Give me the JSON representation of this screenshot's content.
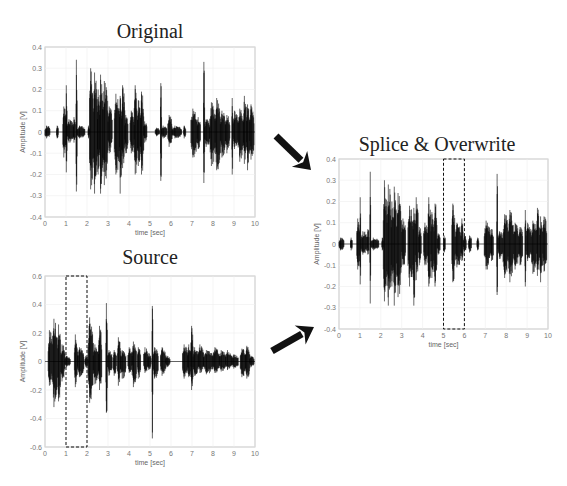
{
  "figure": {
    "arrows": [
      {
        "name": "arrow-original-to-splice",
        "x1": 276,
        "y1": 136,
        "x2": 311,
        "y2": 170
      },
      {
        "name": "arrow-source-to-splice",
        "x1": 272,
        "y1": 351,
        "x2": 314,
        "y2": 327
      }
    ]
  },
  "chart_data": [
    {
      "id": "original",
      "type": "line",
      "title": "Original",
      "xlabel": "time [sec]",
      "ylabel": "Amplitude [V]",
      "xlim": [
        0,
        10
      ],
      "ylim": [
        -0.4,
        0.4
      ],
      "xticks": [
        0,
        1,
        2,
        3,
        4,
        5,
        6,
        7,
        8,
        9,
        10
      ],
      "yticks": [
        0.4,
        0.3,
        0.2,
        0.1,
        0,
        -0.1,
        -0.2,
        -0.3,
        -0.4
      ],
      "ytick_labels": [
        "0.4",
        "0.3",
        "0.2",
        "0.1",
        "0",
        "-0.1",
        "-0.2",
        "-0.3",
        "-0.4"
      ],
      "grid": true,
      "bbox": {
        "left": 45,
        "top": 47,
        "right": 255,
        "bottom": 217
      },
      "title_pos": {
        "x": 150,
        "y": 22
      },
      "bursts": [
        [
          0.0,
          0.25,
          0.03,
          0.03
        ],
        [
          0.55,
          0.65,
          0.03,
          0.03
        ],
        [
          0.85,
          1.0,
          0.12,
          0.12
        ],
        [
          1.0,
          1.05,
          0.22,
          0.19
        ],
        [
          1.05,
          1.35,
          0.06,
          0.05
        ],
        [
          1.35,
          1.45,
          0.07,
          0.05
        ],
        [
          1.48,
          1.53,
          0.34,
          0.28
        ],
        [
          1.53,
          1.9,
          0.03,
          0.03
        ],
        [
          2.05,
          2.12,
          0.03,
          0.03
        ],
        [
          2.12,
          2.3,
          0.3,
          0.27
        ],
        [
          2.3,
          2.5,
          0.28,
          0.29
        ],
        [
          2.5,
          2.6,
          0.2,
          0.2
        ],
        [
          2.6,
          2.75,
          0.27,
          0.29
        ],
        [
          2.75,
          3.0,
          0.24,
          0.25
        ],
        [
          3.0,
          3.2,
          0.12,
          0.1
        ],
        [
          3.3,
          3.55,
          0.18,
          0.2
        ],
        [
          3.55,
          3.65,
          0.17,
          0.29
        ],
        [
          3.65,
          3.8,
          0.22,
          0.17
        ],
        [
          3.8,
          3.95,
          0.08,
          0.1
        ],
        [
          4.05,
          4.25,
          0.1,
          0.1
        ],
        [
          4.25,
          4.4,
          0.22,
          0.2
        ],
        [
          4.4,
          4.55,
          0.15,
          0.16
        ],
        [
          4.55,
          4.7,
          0.19,
          0.2
        ],
        [
          4.7,
          4.85,
          0.05,
          0.05
        ],
        [
          5.25,
          5.45,
          0.02,
          0.02
        ],
        [
          5.5,
          5.55,
          0.23,
          0.23
        ],
        [
          5.55,
          5.8,
          0.03,
          0.03
        ],
        [
          5.85,
          6.05,
          0.08,
          0.07
        ],
        [
          6.05,
          6.5,
          0.03,
          0.03
        ],
        [
          6.6,
          6.7,
          0.03,
          0.03
        ],
        [
          6.95,
          7.25,
          0.11,
          0.12
        ],
        [
          7.25,
          7.4,
          0.07,
          0.08
        ],
        [
          7.55,
          7.6,
          0.33,
          0.24
        ],
        [
          7.6,
          7.85,
          0.06,
          0.07
        ],
        [
          7.85,
          8.1,
          0.14,
          0.16
        ],
        [
          8.1,
          8.35,
          0.16,
          0.18
        ],
        [
          8.35,
          8.6,
          0.1,
          0.12
        ],
        [
          8.6,
          8.8,
          0.08,
          0.1
        ],
        [
          8.9,
          8.95,
          0.16,
          0.2
        ],
        [
          8.95,
          9.2,
          0.1,
          0.08
        ],
        [
          9.2,
          9.45,
          0.11,
          0.14
        ],
        [
          9.45,
          9.6,
          0.17,
          0.15
        ],
        [
          9.6,
          9.75,
          0.13,
          0.18
        ],
        [
          9.75,
          9.95,
          0.13,
          0.13
        ]
      ],
      "dashed_box": null
    },
    {
      "id": "source",
      "type": "line",
      "title": "Source",
      "xlabel": "time [sec]",
      "ylabel": "Amplitude [V]",
      "xlim": [
        0,
        10
      ],
      "ylim": [
        -0.6,
        0.6
      ],
      "xticks": [
        0,
        1,
        2,
        3,
        4,
        5,
        6,
        7,
        8,
        9,
        10
      ],
      "yticks": [
        0.6,
        0.4,
        0.2,
        0,
        -0.2,
        -0.4,
        -0.6
      ],
      "ytick_labels": [
        "0.6",
        "0.4",
        "0.2",
        "0",
        "-0.2",
        "-0.4",
        "-0.6"
      ],
      "grid": true,
      "bbox": {
        "left": 45,
        "top": 276,
        "right": 255,
        "bottom": 447
      },
      "title_pos": {
        "x": 150,
        "y": 248
      },
      "bursts": [
        [
          0.15,
          0.35,
          0.22,
          0.17
        ],
        [
          0.35,
          0.6,
          0.3,
          0.32
        ],
        [
          0.6,
          0.75,
          0.26,
          0.28
        ],
        [
          0.75,
          0.95,
          0.12,
          0.14
        ],
        [
          0.95,
          1.2,
          0.04,
          0.04
        ],
        [
          1.4,
          1.55,
          0.19,
          0.18
        ],
        [
          1.55,
          1.85,
          0.1,
          0.11
        ],
        [
          1.9,
          2.05,
          0.04,
          0.04
        ],
        [
          2.05,
          2.3,
          0.31,
          0.29
        ],
        [
          2.3,
          2.55,
          0.12,
          0.16
        ],
        [
          2.55,
          2.7,
          0.25,
          0.2
        ],
        [
          2.9,
          2.98,
          0.41,
          0.36
        ],
        [
          2.98,
          3.2,
          0.08,
          0.1
        ],
        [
          3.25,
          3.4,
          0.08,
          0.1
        ],
        [
          3.45,
          3.6,
          0.17,
          0.17
        ],
        [
          3.6,
          3.85,
          0.08,
          0.12
        ],
        [
          3.95,
          4.15,
          0.1,
          0.08
        ],
        [
          4.15,
          4.35,
          0.14,
          0.18
        ],
        [
          4.4,
          4.55,
          0.1,
          0.12
        ],
        [
          4.7,
          4.9,
          0.1,
          0.08
        ],
        [
          4.9,
          5.05,
          0.06,
          0.06
        ],
        [
          5.1,
          5.14,
          0.39,
          0.54
        ],
        [
          5.14,
          5.4,
          0.1,
          0.12
        ],
        [
          5.5,
          5.75,
          0.1,
          0.1
        ],
        [
          5.75,
          5.95,
          0.04,
          0.04
        ],
        [
          6.55,
          6.8,
          0.12,
          0.12
        ],
        [
          6.8,
          6.95,
          0.12,
          0.11
        ],
        [
          6.95,
          7.05,
          0.25,
          0.2
        ],
        [
          7.05,
          7.3,
          0.1,
          0.1
        ],
        [
          7.3,
          7.55,
          0.12,
          0.08
        ],
        [
          7.55,
          8.0,
          0.08,
          0.09
        ],
        [
          8.0,
          8.3,
          0.1,
          0.08
        ],
        [
          8.3,
          8.6,
          0.08,
          0.07
        ],
        [
          8.6,
          8.9,
          0.08,
          0.06
        ],
        [
          8.9,
          9.2,
          0.05,
          0.05
        ],
        [
          9.3,
          9.55,
          0.09,
          0.11
        ],
        [
          9.55,
          9.75,
          0.11,
          0.12
        ],
        [
          9.75,
          9.95,
          0.04,
          0.04
        ]
      ],
      "dashed_box": {
        "x0": 1,
        "x1": 2
      }
    },
    {
      "id": "splice",
      "type": "line",
      "title": "Splice & Overwrite",
      "xlabel": "time [sec]",
      "ylabel": "Amplitude [V]",
      "xlim": [
        0,
        10
      ],
      "ylim": [
        -0.4,
        0.4
      ],
      "xticks": [
        0,
        1,
        2,
        3,
        4,
        5,
        6,
        7,
        8,
        9,
        10
      ],
      "yticks": [
        0.4,
        0.3,
        0.2,
        0.1,
        0,
        -0.1,
        -0.2,
        -0.3,
        -0.4
      ],
      "ytick_labels": [
        "0.4",
        "0.3",
        "0.2",
        "0.1",
        "0",
        "-0.1",
        "-0.2",
        "-0.3",
        "-0.4"
      ],
      "grid": true,
      "bbox": {
        "left": 339,
        "top": 159,
        "right": 548,
        "bottom": 329
      },
      "title_pos": {
        "x": 437,
        "y": 135
      },
      "bursts": [
        [
          0.0,
          0.25,
          0.03,
          0.03
        ],
        [
          0.55,
          0.65,
          0.03,
          0.03
        ],
        [
          0.85,
          1.0,
          0.12,
          0.12
        ],
        [
          1.0,
          1.05,
          0.22,
          0.19
        ],
        [
          1.05,
          1.35,
          0.06,
          0.05
        ],
        [
          1.35,
          1.45,
          0.07,
          0.05
        ],
        [
          1.48,
          1.53,
          0.34,
          0.28
        ],
        [
          1.53,
          1.9,
          0.03,
          0.03
        ],
        [
          2.05,
          2.12,
          0.03,
          0.03
        ],
        [
          2.12,
          2.3,
          0.3,
          0.27
        ],
        [
          2.3,
          2.5,
          0.28,
          0.29
        ],
        [
          2.5,
          2.6,
          0.2,
          0.2
        ],
        [
          2.6,
          2.75,
          0.27,
          0.29
        ],
        [
          2.75,
          3.0,
          0.24,
          0.25
        ],
        [
          3.0,
          3.2,
          0.12,
          0.1
        ],
        [
          3.3,
          3.55,
          0.18,
          0.2
        ],
        [
          3.55,
          3.65,
          0.17,
          0.29
        ],
        [
          3.65,
          3.8,
          0.22,
          0.17
        ],
        [
          3.8,
          3.95,
          0.08,
          0.1
        ],
        [
          4.05,
          4.25,
          0.1,
          0.1
        ],
        [
          4.25,
          4.4,
          0.22,
          0.2
        ],
        [
          4.4,
          4.55,
          0.15,
          0.16
        ],
        [
          4.55,
          4.7,
          0.19,
          0.2
        ],
        [
          4.7,
          4.85,
          0.05,
          0.05
        ],
        [
          5.0,
          5.1,
          0.04,
          0.04
        ],
        [
          5.4,
          5.55,
          0.19,
          0.18
        ],
        [
          5.55,
          5.85,
          0.1,
          0.11
        ],
        [
          5.85,
          5.95,
          0.12,
          0.08
        ],
        [
          5.95,
          6.1,
          0.04,
          0.04
        ],
        [
          6.2,
          6.35,
          0.04,
          0.04
        ],
        [
          6.6,
          6.7,
          0.03,
          0.03
        ],
        [
          6.95,
          7.25,
          0.11,
          0.12
        ],
        [
          7.25,
          7.4,
          0.07,
          0.08
        ],
        [
          7.55,
          7.6,
          0.33,
          0.24
        ],
        [
          7.6,
          7.85,
          0.06,
          0.07
        ],
        [
          7.85,
          8.1,
          0.14,
          0.16
        ],
        [
          8.1,
          8.35,
          0.16,
          0.18
        ],
        [
          8.35,
          8.6,
          0.1,
          0.12
        ],
        [
          8.6,
          8.8,
          0.08,
          0.1
        ],
        [
          8.9,
          8.95,
          0.16,
          0.2
        ],
        [
          8.95,
          9.2,
          0.1,
          0.08
        ],
        [
          9.2,
          9.45,
          0.11,
          0.14
        ],
        [
          9.45,
          9.6,
          0.17,
          0.15
        ],
        [
          9.6,
          9.75,
          0.13,
          0.18
        ],
        [
          9.75,
          9.95,
          0.13,
          0.13
        ]
      ],
      "dashed_box": {
        "x0": 5,
        "x1": 6
      }
    }
  ]
}
